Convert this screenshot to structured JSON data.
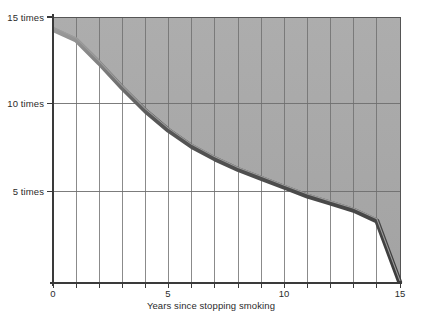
{
  "figure": {
    "top_cut_text": "",
    "background": "#ffffff",
    "fill_color": "#a9a9a9",
    "grid_color": "#6e6e6e",
    "axis_color": "#3a3a3a",
    "line_color": "#4a4a4a",
    "line_highlight": "#8f8f8f"
  },
  "chart_data": {
    "type": "area",
    "title": "",
    "subtitle": "",
    "xlabel": "Years since stopping smoking",
    "ylabel": "",
    "xlim": [
      0,
      15
    ],
    "ylim": [
      0,
      15
    ],
    "grid": true,
    "legend": null,
    "x_ticks": [
      0,
      1,
      2,
      3,
      4,
      5,
      6,
      7,
      8,
      9,
      10,
      11,
      12,
      13,
      14,
      15
    ],
    "x_tick_labels": [
      "0",
      "",
      "",
      "",
      "",
      "5",
      "",
      "",
      "",
      "",
      "10",
      "",
      "",
      "",
      "",
      "15"
    ],
    "y_ticks": [
      5,
      10,
      15
    ],
    "y_tick_labels": [
      "5 times",
      "10 times",
      "15 times"
    ],
    "series": [
      {
        "name": "Relative risk of lung cancer",
        "x": [
          0,
          1,
          2,
          3,
          4,
          5,
          6,
          7,
          8,
          9,
          10,
          11,
          12,
          13,
          14,
          15
        ],
        "values": [
          14.3,
          13.7,
          12.4,
          11.0,
          9.7,
          8.6,
          7.7,
          7.0,
          6.4,
          5.9,
          5.4,
          4.9,
          4.5,
          4.1,
          3.5,
          0.0
        ]
      }
    ],
    "annotations": []
  },
  "axis_labels": {
    "y": [
      {
        "value": 15,
        "text": "15 times"
      },
      {
        "value": 10,
        "text": "10 times"
      },
      {
        "value": 5,
        "text": "5 times"
      }
    ],
    "x": [
      {
        "value": 0,
        "text": "0"
      },
      {
        "value": 5,
        "text": "5"
      },
      {
        "value": 10,
        "text": "10"
      },
      {
        "value": 15,
        "text": "15"
      }
    ],
    "x_title": "Years since stopping smoking"
  }
}
